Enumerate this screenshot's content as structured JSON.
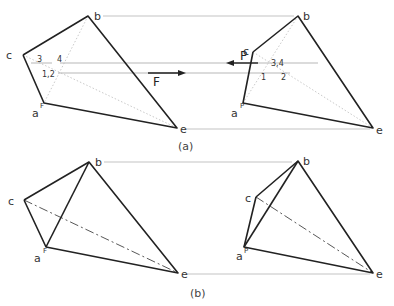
{
  "figure": {
    "part_a": {
      "caption": "(a)",
      "front_view": {
        "vertices": {
          "b": {
            "label": "b",
            "x": 88,
            "y": 16
          },
          "c": {
            "label": "c",
            "x": 23,
            "y": 55
          },
          "a": {
            "label": "a",
            "sup": "F",
            "x": 44,
            "y": 103
          },
          "e": {
            "label": "e",
            "x": 177,
            "y": 128
          }
        },
        "points": {
          "p3": {
            "label": "3"
          },
          "p4": {
            "label": "4"
          },
          "p12": {
            "label": "1,2"
          }
        }
      },
      "profile_view": {
        "vertices": {
          "b": {
            "label": "b",
            "x": 298,
            "y": 16
          },
          "c": {
            "label": "c",
            "x": 253,
            "y": 52
          },
          "a": {
            "label": "a",
            "sup": "P",
            "x": 243,
            "y": 103
          },
          "e": {
            "label": "e",
            "x": 373,
            "y": 128
          }
        },
        "points": {
          "p34": {
            "label": "3,4"
          },
          "p1": {
            "label": "1"
          },
          "p2": {
            "label": "2"
          }
        }
      },
      "arrows": {
        "P": {
          "label": "P",
          "direction": "left"
        },
        "F": {
          "label": "F",
          "direction": "right"
        }
      }
    },
    "part_b": {
      "caption": "(b)",
      "front_view": {
        "vertices": {
          "b": {
            "label": "b",
            "x": 89,
            "y": 172
          },
          "c": {
            "label": "c",
            "x": 24,
            "y": 200
          },
          "a": {
            "label": "a",
            "sup": "F",
            "x": 46,
            "y": 247
          },
          "e": {
            "label": "e",
            "x": 178,
            "y": 273
          }
        }
      },
      "profile_view": {
        "vertices": {
          "b": {
            "label": "b",
            "x": 298,
            "y": 161
          },
          "c": {
            "label": "c",
            "x": 256,
            "y": 197
          },
          "a": {
            "label": "a",
            "sup": "P",
            "x": 244,
            "y": 247
          },
          "e": {
            "label": "e",
            "x": 373,
            "y": 273
          }
        }
      }
    }
  }
}
